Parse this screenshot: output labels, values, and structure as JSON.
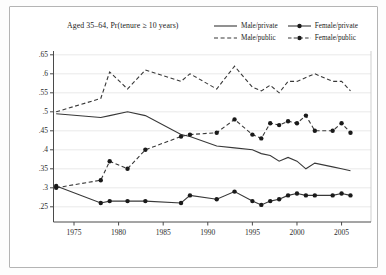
{
  "figure": {
    "background": "#ffffff",
    "border_color": "#b4b4b4",
    "line_color": "#383838",
    "marker_color": "#1a1a1a",
    "grid_color": "#e3e3e3"
  },
  "chart_data": {
    "type": "line",
    "title": "Aged 35–64, Pr(tenure ≥ 10 years)",
    "xlabel": "",
    "ylabel": "",
    "x": [
      1973,
      1978,
      1979,
      1981,
      1983,
      1987,
      1988,
      1991,
      1993,
      1995,
      1996,
      1997,
      1998,
      1999,
      2000,
      2001,
      2002,
      2004,
      2005,
      2006
    ],
    "series": [
      {
        "name": "Male/private",
        "dash": "none",
        "marker": false,
        "values": [
          0.495,
          0.485,
          0.49,
          0.5,
          0.49,
          0.44,
          0.435,
          0.41,
          0.405,
          0.4,
          0.39,
          0.385,
          0.37,
          0.38,
          0.37,
          0.35,
          0.365,
          0.355,
          0.35,
          0.345
        ]
      },
      {
        "name": "Male/public",
        "dash": "dashed",
        "marker": false,
        "values": [
          0.5,
          0.535,
          0.605,
          0.56,
          0.61,
          0.58,
          0.6,
          0.56,
          0.62,
          0.565,
          0.555,
          0.57,
          0.55,
          0.58,
          0.58,
          0.59,
          0.6,
          0.58,
          0.58,
          0.555
        ]
      },
      {
        "name": "Female/private",
        "dash": "none",
        "marker": true,
        "values": [
          0.305,
          0.26,
          0.265,
          0.265,
          0.265,
          0.26,
          0.28,
          0.27,
          0.29,
          0.265,
          0.255,
          0.265,
          0.27,
          0.28,
          0.285,
          0.28,
          0.28,
          0.28,
          0.285,
          0.28
        ]
      },
      {
        "name": "Female/public",
        "dash": "dashed",
        "marker": true,
        "values": [
          0.3,
          0.32,
          0.37,
          0.35,
          0.4,
          0.435,
          0.44,
          0.445,
          0.48,
          0.44,
          0.43,
          0.47,
          0.465,
          0.475,
          0.47,
          0.49,
          0.45,
          0.45,
          0.47,
          0.445
        ]
      }
    ],
    "xticks": [
      1975,
      1980,
      1985,
      1990,
      1995,
      2000,
      2005
    ],
    "ytick_values": [
      0.25,
      0.3,
      0.35,
      0.4,
      0.45,
      0.5,
      0.55,
      0.6,
      0.65
    ],
    "ytick_labels": [
      ".25",
      ".3",
      ".35",
      ".4",
      ".45",
      ".5",
      ".55",
      ".6",
      ".65"
    ],
    "xlim": [
      1972.7,
      2008.3
    ],
    "ylim": [
      0.21,
      0.66
    ],
    "grid": true,
    "legend_position": "top-right"
  },
  "legend": {
    "items": [
      "Male/private",
      "Female/private",
      "Male/public",
      "Female/public"
    ]
  }
}
